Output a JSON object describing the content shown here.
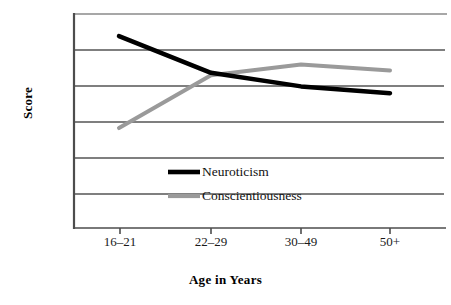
{
  "chart_data": {
    "type": "line",
    "title": "",
    "xlabel": "Age in Years",
    "ylabel": "Score",
    "categories": [
      "16–21",
      "22–29",
      "30–49",
      "50+"
    ],
    "grid": true,
    "gridlines": 7,
    "axis_tick_labels_y": [],
    "ylim": [
      0,
      6
    ],
    "legend_position": "inside-center",
    "series": [
      {
        "name": "Neuroticism",
        "color": "#000000",
        "width": 4.5,
        "values": [
          5.38,
          4.35,
          3.97,
          3.78
        ]
      },
      {
        "name": "Conscientiousness",
        "color": "#9a9a9a",
        "width": 4.0,
        "values": [
          2.8,
          4.28,
          4.58,
          4.42
        ]
      }
    ],
    "annotations": []
  },
  "axes": {
    "x_label": "Age in Years",
    "y_label": "Score",
    "tick_labels": [
      "16–21",
      "22–29",
      "30–49",
      "50+"
    ]
  },
  "legend": {
    "items": [
      {
        "label": "Neuroticism",
        "color": "#000000"
      },
      {
        "label": "Conscientiousness",
        "color": "#9a9a9a"
      }
    ]
  },
  "colors": {
    "neuroticism": "#000000",
    "conscientiousness": "#9a9a9a",
    "axis": "#4d4d4d",
    "grid": "#555555",
    "background": "#ffffff"
  }
}
